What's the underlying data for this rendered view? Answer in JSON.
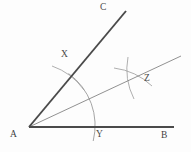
{
  "diagram": {
    "canvas": {
      "width": 191,
      "height": 152,
      "background": "#fdfdfd"
    },
    "colors": {
      "ray_dark": "#4a4a4a",
      "ray_light": "#7d7d7d",
      "arc": "#8e8e8e",
      "label": "#4a4a4a"
    },
    "points": {
      "A": {
        "label": "A",
        "x": 29,
        "y": 127,
        "label_x": 10,
        "label_y": 130
      },
      "B": {
        "label": "B",
        "x": 174,
        "y": 127,
        "label_x": 161,
        "label_y": 131
      },
      "C": {
        "label": "C",
        "x": 126,
        "y": 11,
        "label_x": 100,
        "label_y": 3
      },
      "X": {
        "label": "X",
        "x": 68,
        "y": 76,
        "label_x": 61,
        "label_y": 50
      },
      "Y": {
        "label": "Y",
        "x": 93,
        "y": 127,
        "label_x": 96,
        "label_y": 130
      },
      "Z": {
        "label": "Z",
        "x": 133,
        "y": 78,
        "label_x": 144,
        "label_y": 74
      }
    },
    "segments": [
      {
        "name": "ray-AB",
        "from": "A",
        "to": "B",
        "weight": 1.9,
        "shade": "ray_dark"
      },
      {
        "name": "ray-AC",
        "from": "A",
        "to": "C",
        "weight": 1.9,
        "shade": "ray_dark"
      },
      {
        "name": "ray-AZ-bisector",
        "from": "A",
        "to": "far-right",
        "weight": 0.85,
        "shade": "ray_light"
      }
    ],
    "arcs": [
      {
        "name": "arc-XY-centered-at-A",
        "center": "A",
        "radius": 64
      },
      {
        "name": "arc-from-X",
        "center": "X",
        "radius": 65
      },
      {
        "name": "arc-from-Y",
        "center": "Y",
        "radius": 65
      }
    ],
    "caption": ""
  }
}
